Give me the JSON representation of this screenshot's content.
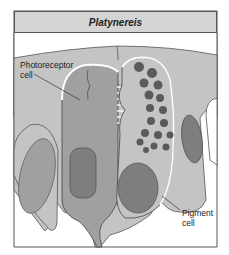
{
  "title": "Platynereis",
  "labels": {
    "photoreceptor": [
      "Photoreceptor",
      "cell"
    ],
    "pigment": [
      "Pigment",
      "cell"
    ]
  },
  "colors": {
    "tissue_light": "#c4c4c4",
    "cell_medium": "#a0a0a0",
    "nucleus_dark": "#7e7e7e",
    "granule": "#5a5a5a",
    "title_bg": "#d4d4d4",
    "outline": "#555555"
  }
}
